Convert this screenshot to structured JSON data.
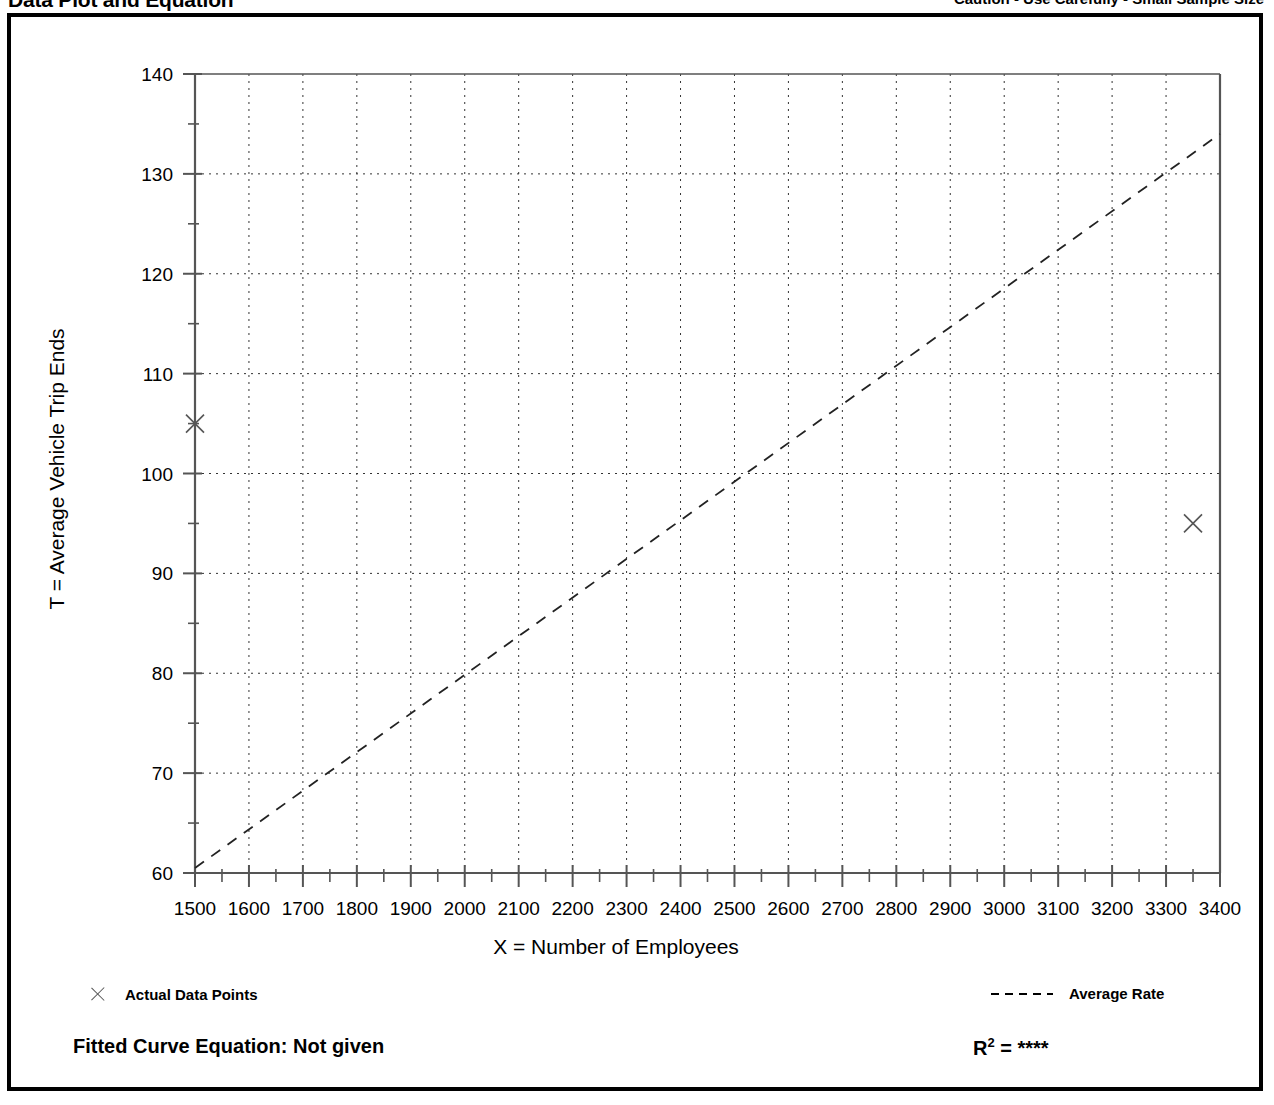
{
  "header": {
    "title": "Data Plot and Equation",
    "caution": "Caution - Use Carefully - Small Sample Size"
  },
  "axis": {
    "ylabel": "T = Average Vehicle Trip Ends",
    "xlabel": "X = Number of Employees"
  },
  "legend": {
    "data_points_label": "Actual Data Points",
    "average_rate_label": "Average Rate",
    "data_point_marker": "x-marker-icon",
    "average_rate_marker": "dashed-line-icon"
  },
  "footer": {
    "fitted_equation_label": "Fitted Curve Equation:  Not given",
    "r2_label": "R",
    "r2_exponent": "2",
    "r2_equals": " = ",
    "r2_value": "****"
  },
  "chart_data": {
    "type": "scatter",
    "title": "Data Plot and Equation",
    "xlabel": "X = Number of Employees",
    "ylabel": "T = Average Vehicle Trip Ends",
    "xlim": [
      1500,
      3400
    ],
    "ylim": [
      60,
      140
    ],
    "xticks": [
      1500,
      1600,
      1700,
      1800,
      1900,
      2000,
      2100,
      2200,
      2300,
      2400,
      2500,
      2600,
      2700,
      2800,
      2900,
      3000,
      3100,
      3200,
      3300,
      3400
    ],
    "yticks": [
      60,
      70,
      80,
      90,
      100,
      110,
      120,
      130,
      140
    ],
    "yminorticks": [
      65,
      75,
      85,
      95,
      105,
      115,
      125,
      135
    ],
    "xminorticks": [
      1550,
      1650,
      1750,
      1850,
      1950,
      2050,
      2150,
      2250,
      2350,
      2450,
      2550,
      2650,
      2750,
      2850,
      2950,
      3050,
      3150,
      3250,
      3350
    ],
    "grid": true,
    "grid_style": "dotted",
    "legend_position": "below-plot",
    "series": [
      {
        "name": "Actual Data Points",
        "type": "scatter",
        "marker": "x",
        "points": [
          {
            "x": 1500,
            "y": 105
          },
          {
            "x": 3350,
            "y": 95
          }
        ]
      },
      {
        "name": "Average Rate",
        "type": "line",
        "style": "dashed",
        "points": [
          {
            "x": 1500,
            "y": 60.5
          },
          {
            "x": 3400,
            "y": 134.0
          }
        ]
      }
    ]
  }
}
